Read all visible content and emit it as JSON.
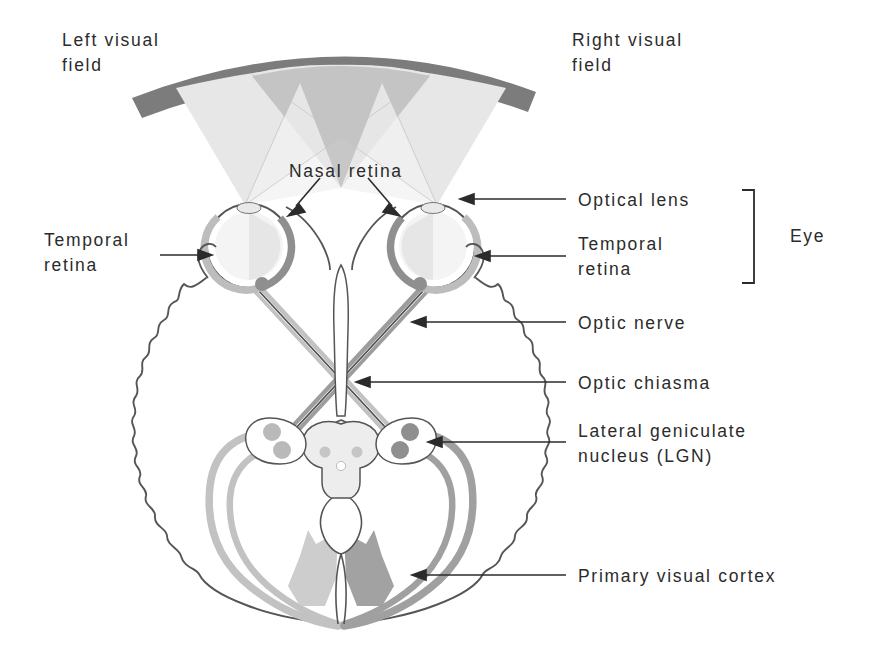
{
  "figure": {
    "labels": [
      {
        "id": "left-visual-field",
        "text": "Left visual\nfield",
        "x": 62,
        "y": 28
      },
      {
        "id": "right-visual-field",
        "text": "Right visual\nfield",
        "x": 572,
        "y": 28
      },
      {
        "id": "nasal-retina",
        "text": "Nasal retina",
        "x": 289,
        "y": 159
      },
      {
        "id": "temporal-retina-left",
        "text": "Temporal\nretina",
        "x": 44,
        "y": 228
      },
      {
        "id": "optical-lens",
        "text": "Optical lens",
        "x": 578,
        "y": 192
      },
      {
        "id": "temporal-retina-right",
        "text": "Temporal\nretina",
        "x": 578,
        "y": 230
      },
      {
        "id": "eye-bracket-label",
        "text": "Eye",
        "x": 821,
        "y": 234
      },
      {
        "id": "optic-nerve",
        "text": "Optic nerve",
        "x": 578,
        "y": 310
      },
      {
        "id": "optic-chiasma",
        "text": "Optic chiasma",
        "x": 578,
        "y": 372
      },
      {
        "id": "lateral-geniculate-nucleus",
        "text": "Lateral geniculate\nnucleus (LGN)",
        "x": 578,
        "y": 421
      },
      {
        "id": "primary-visual-cortex",
        "text": "Primary visual cortex",
        "x": 578,
        "y": 563
      }
    ],
    "colors": {
      "ink": "#2b2b2b",
      "outline": "#555555",
      "field_arc": "#777777",
      "cone_light": "#ebebeb",
      "cone_mid": "#d8d8d8",
      "cone_dark": "#b4b4b4",
      "pathway_light": "#bdbdbd",
      "pathway_dark": "#8c8c8c",
      "cortex_light": "#c9c9c9",
      "cortex_dark": "#9a9a9a",
      "background": "#ffffff"
    },
    "structures": [
      "visual-field-arc",
      "left-eye",
      "right-eye",
      "optic-nerves",
      "optic-chiasma",
      "left-lgn",
      "right-lgn",
      "brainstem",
      "optic-radiations",
      "visual-cortex",
      "brain-outline"
    ]
  }
}
